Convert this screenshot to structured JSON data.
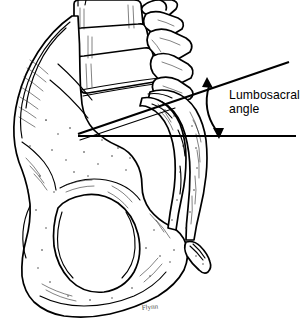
{
  "figure": {
    "title": "Lumbosacral angle",
    "background_color": "#ffffff",
    "ink_color": "#000000",
    "width": 308,
    "height": 329
  },
  "annotation": {
    "label_line1": "Lumbosacral",
    "label_line2": "angle",
    "label_text": "Lumbosacral\nangle",
    "arrow_type": "double-headed-arc",
    "arrow_color": "#000000"
  },
  "reference_lines": {
    "horizontal": {
      "name": "horizontal-reference-line",
      "x1": 78,
      "y1": 136,
      "x2": 296,
      "y2": 136
    },
    "oblique": {
      "name": "sacral-endplate-line",
      "x1": 78,
      "y1": 134,
      "x2": 289,
      "y2": 62
    }
  },
  "anatomy": {
    "parts": [
      "lumbar-vertebrae",
      "spinous-processes",
      "ilium",
      "iliac-crest",
      "sacrum",
      "coccyx",
      "obturator-foramen",
      "ischium",
      "pubis",
      "acetabulum"
    ]
  },
  "signature": {
    "text": "Flynn"
  }
}
